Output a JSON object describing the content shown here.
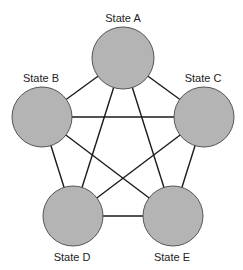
{
  "diagram": {
    "type": "complete-graph",
    "node_fill": "#b4b4b4",
    "node_stroke": "#555555",
    "edge_color": "#1a1a1a",
    "nodes": [
      {
        "id": "A",
        "label": "State A",
        "cx": 123,
        "cy": 58,
        "r": 31,
        "lx": 123,
        "ly": 22
      },
      {
        "id": "B",
        "label": "State B",
        "cx": 42,
        "cy": 117,
        "r": 30,
        "lx": 41,
        "ly": 82
      },
      {
        "id": "C",
        "label": "State C",
        "cx": 204,
        "cy": 117,
        "r": 30,
        "lx": 203,
        "ly": 82
      },
      {
        "id": "D",
        "label": "State D",
        "cx": 73,
        "cy": 216,
        "r": 30,
        "lx": 72,
        "ly": 261
      },
      {
        "id": "E",
        "label": "State E",
        "cx": 173,
        "cy": 216,
        "r": 30,
        "lx": 172,
        "ly": 261
      }
    ],
    "edges": [
      [
        "A",
        "B"
      ],
      [
        "A",
        "C"
      ],
      [
        "A",
        "D"
      ],
      [
        "A",
        "E"
      ],
      [
        "B",
        "C"
      ],
      [
        "B",
        "D"
      ],
      [
        "B",
        "E"
      ],
      [
        "C",
        "D"
      ],
      [
        "C",
        "E"
      ],
      [
        "D",
        "E"
      ]
    ]
  }
}
